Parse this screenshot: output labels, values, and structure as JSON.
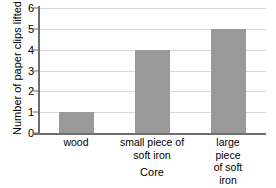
{
  "chart_data": {
    "type": "bar",
    "title": "",
    "categories": [
      "wood",
      "small piece of\nsoft iron",
      "large piece\nof soft iron"
    ],
    "values": [
      1,
      4,
      5
    ],
    "xlabel": "Core",
    "ylabel": "Number of paper clips lifted",
    "ylim": [
      0,
      6
    ],
    "yticks": [
      0,
      1,
      2,
      3,
      4,
      5,
      6
    ],
    "ytick_labels": [
      "0",
      "1",
      "2",
      "3",
      "4",
      "5",
      "6"
    ],
    "grid": true,
    "legend": false,
    "bar_color": "#999999",
    "gridline_color": "#d9d9d9",
    "axis_color": "#6e6e6e",
    "background_color": "#ffffff"
  }
}
